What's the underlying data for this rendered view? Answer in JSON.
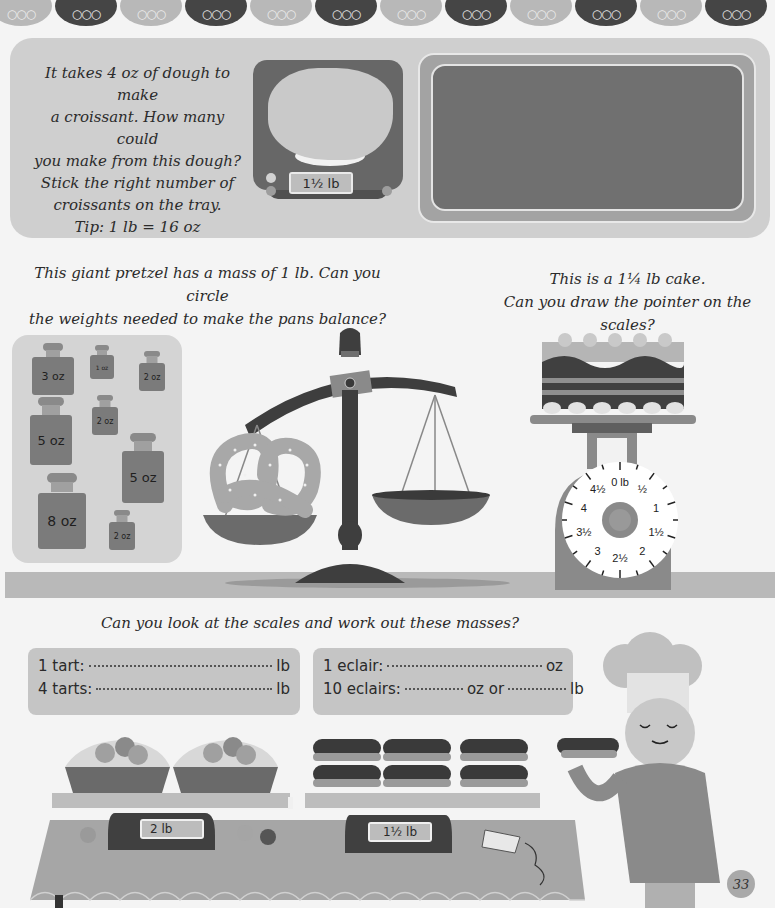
{
  "header": {
    "scallop_pattern": [
      "light",
      "dark",
      "light",
      "dark",
      "light",
      "dark",
      "light",
      "dark",
      "light",
      "dark",
      "light",
      "dark"
    ],
    "drop_glyph": "⁔⁔⁔"
  },
  "croissant_activity": {
    "instructions_lines": [
      "It takes 4 oz of dough to make",
      "a croissant. How many could",
      "you make from this dough?",
      "Stick the right number of",
      "croissants on the tray.",
      "Tip: 1 lb = 16 oz"
    ],
    "scale_display": "1½ lb",
    "tray_label": "sticker tray"
  },
  "pretzel_activity": {
    "instructions_lines": [
      "This giant pretzel has a mass of 1 lb. Can you circle",
      "the weights needed to make the pans balance?"
    ],
    "weights": [
      {
        "label": "3 oz"
      },
      {
        "label": "1 oz"
      },
      {
        "label": "2 oz"
      },
      {
        "label": "2 oz"
      },
      {
        "label": "5 oz"
      },
      {
        "label": "5 oz"
      },
      {
        "label": "8 oz"
      },
      {
        "label": "2 oz"
      }
    ]
  },
  "cake_activity": {
    "instructions_lines": [
      "This is a 1¼ lb cake.",
      "Can you draw the pointer on the scales?"
    ],
    "dial_labels": [
      "0 lb",
      "½",
      "1",
      "1½",
      "2",
      "2½",
      "3",
      "3½",
      "4",
      "4½"
    ]
  },
  "masses_activity": {
    "instructions": "Can you look at the scales and work out these masses?",
    "tarts": [
      {
        "label": "1 tart:",
        "unit": "lb"
      },
      {
        "label": "4 tarts:",
        "unit": "lb"
      }
    ],
    "eclairs": {
      "row1": {
        "label": "1 eclair:",
        "unit": "oz"
      },
      "row2": {
        "label": "10 eclairs:",
        "mid": "oz or",
        "unit": "lb"
      }
    },
    "tart_scale_display": "2 lb",
    "eclair_scale_display": "1½ lb"
  },
  "page_number": "33"
}
